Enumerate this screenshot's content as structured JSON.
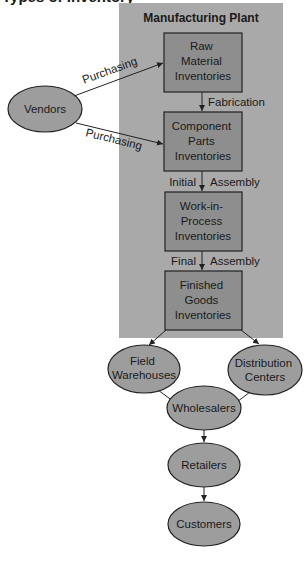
{
  "title": "Types of Inventory",
  "plant": {
    "label": "Manufacturing Plant"
  },
  "colors": {
    "plant_bg": "#a9a9a9",
    "box_fill": "#8e8e8e",
    "ellipse_fill": "#9d9d9d",
    "stroke": "#222222"
  },
  "source": {
    "label": "Vendors"
  },
  "boxes": [
    {
      "lines": [
        "Raw",
        "Material",
        "Inventories"
      ]
    },
    {
      "lines": [
        "Component",
        "Parts",
        "Inventories"
      ]
    },
    {
      "lines": [
        "Work-in-",
        "Process",
        "Inventories"
      ]
    },
    {
      "lines": [
        "Finished",
        "Goods",
        "Inventories"
      ]
    }
  ],
  "edge_labels": {
    "purchasing_top": "Purchasing",
    "purchasing_bottom": "Purchasing",
    "fabrication": "Fabrication",
    "initial": "Initial",
    "initial_assembly": "Assembly",
    "final": "Final",
    "final_assembly": "Assembly"
  },
  "distribution": {
    "field_warehouses": [
      "Field",
      "Warehouses"
    ],
    "distribution_centers": [
      "Distribution",
      "Centers"
    ],
    "wholesalers": "Wholesalers",
    "retailers": "Retailers",
    "customers": "Customers"
  }
}
